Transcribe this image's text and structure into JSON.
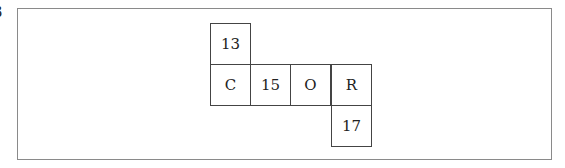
{
  "clipped_label": "3",
  "grid": {
    "cells": [
      {
        "row": 0,
        "col": 0,
        "text": "13"
      },
      {
        "row": 1,
        "col": 0,
        "text": "C"
      },
      {
        "row": 1,
        "col": 1,
        "text": "15"
      },
      {
        "row": 1,
        "col": 2,
        "text": "O"
      },
      {
        "row": 1,
        "col": 3,
        "text": "R"
      },
      {
        "row": 2,
        "col": 3,
        "text": "17"
      }
    ]
  }
}
